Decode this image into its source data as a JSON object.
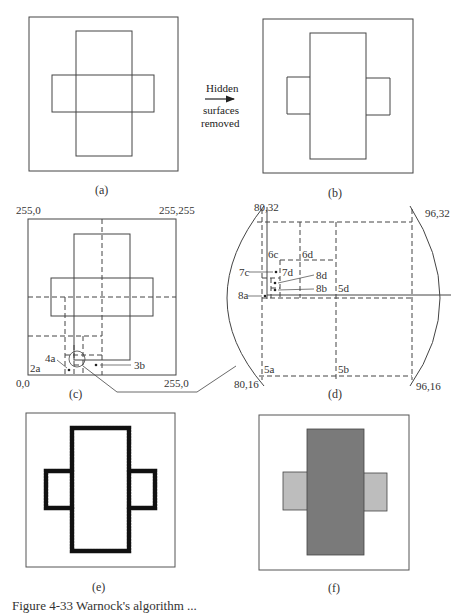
{
  "figure": {
    "panels": {
      "a": {
        "label": "(a)"
      },
      "b": {
        "label": "(b)"
      },
      "c": {
        "label": "(c)",
        "corners": {
          "top_left": "255,0",
          "top_right": "255,255",
          "bottom_left": "0,0",
          "bottom_right": "255,0"
        },
        "annotations": [
          "2a",
          "4a",
          "3b"
        ]
      },
      "d": {
        "label": "(d)",
        "corners": {
          "top_left": "80,32",
          "top_right": "96,32",
          "bottom_left": "80,16",
          "bottom_right": "96,16"
        },
        "annotations": [
          "6c",
          "6d",
          "7c",
          "7d",
          "8d",
          "8b",
          "8a",
          "5d",
          "5a",
          "5b"
        ]
      },
      "e": {
        "label": "(e)"
      },
      "f": {
        "label": "(f)"
      }
    },
    "arrow": {
      "top": "Hidden",
      "bottom_line1": "surfaces",
      "bottom_line2": "removed"
    },
    "colors": {
      "dark_fill": "#7a7a7a",
      "light_fill": "#bdbdbd",
      "stroke": "#333333"
    },
    "caption": "Figure 4-33  Warnock's algorithm ..."
  }
}
